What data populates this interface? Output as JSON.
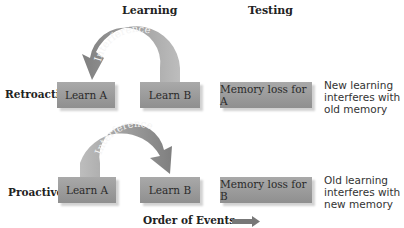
{
  "headers": {
    "learning": "Learning",
    "testing": "Testing"
  },
  "rows": [
    {
      "label": "Retroactive",
      "box_a": "Learn A",
      "box_b": "Learn B",
      "result": "Memory loss for A",
      "arrow_label": "Interference",
      "arrow_direction": "B-to-A",
      "description": [
        "New learning",
        "interferes with",
        "old memory"
      ]
    },
    {
      "label": "Proactive",
      "box_a": "Learn A",
      "box_b": "Learn B",
      "result": "Memory loss for B",
      "arrow_label": "Interference",
      "arrow_direction": "A-to-B",
      "description": [
        "Old learning",
        "interferes with",
        "new memory"
      ]
    }
  ],
  "footer": {
    "order_label": "Order of Events",
    "icon": "right-arrow-icon"
  },
  "colors": {
    "box": "#9a9a9a",
    "arrow": "#8a8a8a",
    "text": "#222222"
  }
}
